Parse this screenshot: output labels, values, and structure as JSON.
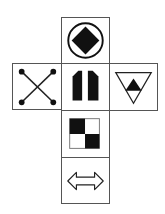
{
  "diagram": {
    "type": "cube-net",
    "stroke_color": "#555555",
    "fill_color": "#111111",
    "faces": [
      {
        "id": "top",
        "position": "row1-col2",
        "symbol": "filled diamond inside circle",
        "icon": "diamond-in-circle-icon"
      },
      {
        "id": "left",
        "position": "row2-col1",
        "symbol": "X with dot-terminated ends",
        "icon": "x-with-dots-icon"
      },
      {
        "id": "center",
        "position": "row2-col2",
        "symbol": "two filled pillars with chamfered outer tops",
        "icon": "twin-pillars-icon"
      },
      {
        "id": "right",
        "position": "row2-col3",
        "symbol": "filled triangle inside inverted outlined triangle",
        "icon": "triangle-in-inverted-triangle-icon"
      },
      {
        "id": "lower",
        "position": "row3-col2",
        "symbol": "2x2 checkerboard, top-left and bottom-right filled",
        "icon": "checkerboard-icon"
      },
      {
        "id": "bottom",
        "position": "row4-col2",
        "symbol": "outlined double-headed horizontal arrow",
        "icon": "double-arrow-icon"
      }
    ]
  }
}
